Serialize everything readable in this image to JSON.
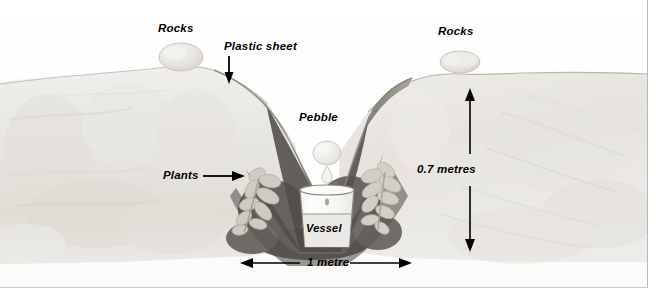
{
  "diagram": {
    "type": "solar-still-cross-section",
    "title_present": false,
    "labels": {
      "rocks_left": "Rocks",
      "rocks_right": "Rocks",
      "plastic_sheet": "Plastic sheet",
      "pebble": "Pebble",
      "plants": "Plants",
      "vessel": "Vessel"
    },
    "dimensions": {
      "depth": "0.7 metres",
      "width": "1 metre"
    },
    "annotations": [
      {
        "name": "rocks-left-label",
        "text": "Rocks",
        "pointer": "none"
      },
      {
        "name": "rocks-right-label",
        "text": "Rocks",
        "pointer": "none"
      },
      {
        "name": "plastic-sheet-label",
        "text": "Plastic sheet",
        "pointer": "arrow-down"
      },
      {
        "name": "pebble-label",
        "text": "Pebble",
        "pointer": "none"
      },
      {
        "name": "plants-label",
        "text": "Plants",
        "pointer": "arrow-right"
      },
      {
        "name": "vessel-label",
        "text": "Vessel",
        "pointer": "none"
      },
      {
        "name": "depth-dimension",
        "text": "0.7 metres",
        "pointer": "double-arrow-vertical"
      },
      {
        "name": "width-dimension",
        "text": "1 metre",
        "pointer": "double-arrow-horizontal"
      }
    ],
    "colors": {
      "ink": "#000000",
      "sand_light": "#f2f1ee",
      "sand_mid": "#e4e2dd",
      "sand_shadow": "#d5d2cc",
      "pit_soil_dark": "#6f6b66",
      "pit_soil_darker": "#56524e",
      "plastic_sheet": "#b9b5ae",
      "plant_leaf": "#cfcac2",
      "pebble": "#eceae5",
      "vessel_glass": "#fbfbfa",
      "water": "#e7e7e4",
      "frame_line": "#b9b9b9"
    }
  }
}
